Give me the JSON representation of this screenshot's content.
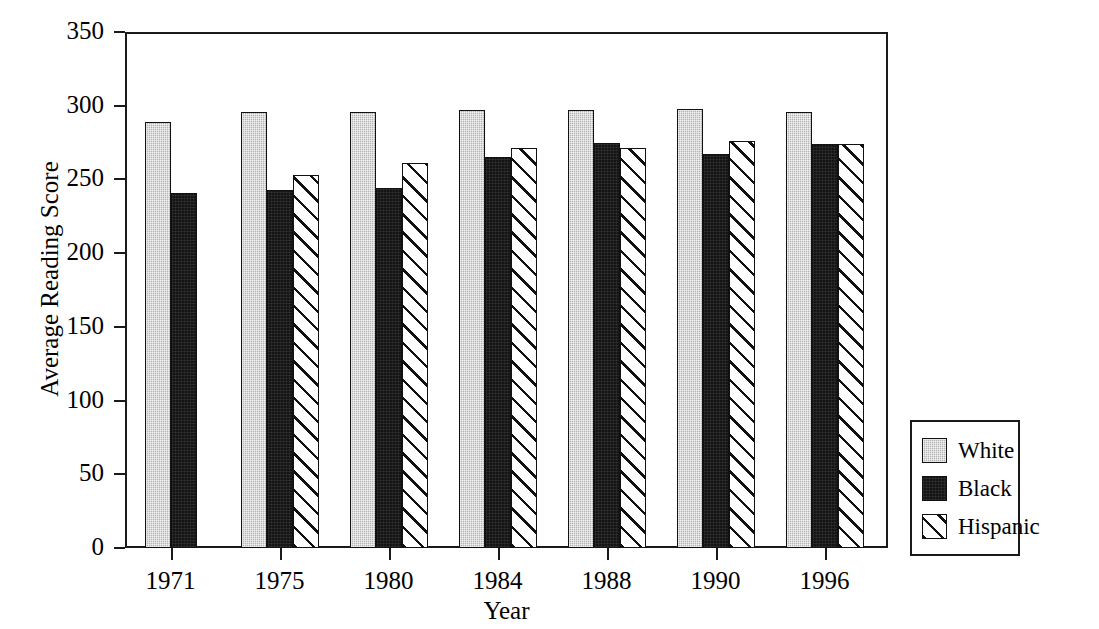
{
  "chart_data": {
    "type": "bar",
    "title": "",
    "xlabel": "Year",
    "ylabel": "Average Reading Score",
    "categories": [
      "1971",
      "1975",
      "1980",
      "1984",
      "1988",
      "1990",
      "1996"
    ],
    "series": [
      {
        "name": "White",
        "fill": "solid-gray",
        "color": "#b3b3b3",
        "values": [
          289,
          296,
          296,
          297,
          297,
          298,
          296
        ]
      },
      {
        "name": "Black",
        "fill": "solid-black",
        "color": "#141414",
        "values": [
          241,
          243,
          244,
          265,
          275,
          267,
          274
        ]
      },
      {
        "name": "Hispanic",
        "fill": "diagonal-hatch",
        "color": "#ffffff",
        "values": [
          null,
          253,
          261,
          271,
          271,
          276,
          274
        ]
      }
    ],
    "ylim": [
      0,
      350
    ],
    "yticks": [
      0,
      50,
      100,
      150,
      200,
      250,
      300,
      350
    ],
    "ytick_labels": [
      "0",
      "50",
      "100",
      "150",
      "200",
      "250",
      "300",
      "350"
    ],
    "grid": false,
    "legend_position": "right-outside",
    "legend_entries": [
      "White",
      "Black",
      "Hispanic"
    ]
  },
  "axes": {
    "y_title": "Average Reading Score",
    "x_title": "Year"
  },
  "legend": {
    "items": [
      {
        "label": "White"
      },
      {
        "label": "Black"
      },
      {
        "label": "Hispanic"
      }
    ]
  },
  "colors": {
    "axis": "#1a1a1a",
    "bar_outline": "#111111",
    "white_series": "#b3b3b3",
    "black_series": "#141414",
    "hispanic_series": "#ffffff",
    "background": "#ffffff"
  }
}
